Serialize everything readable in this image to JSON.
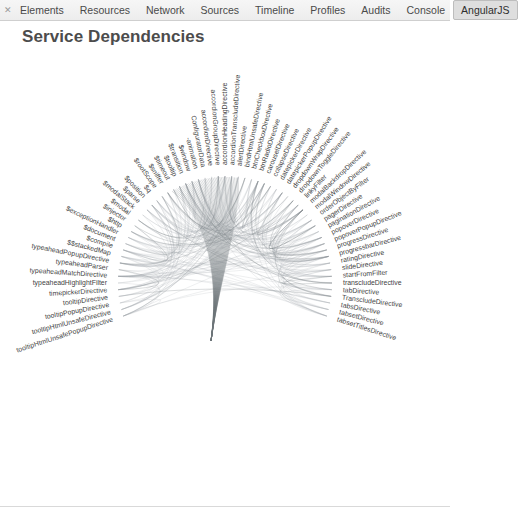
{
  "window": {
    "close_icon": "close-icon",
    "close_glyph": "✕"
  },
  "toolbar": {
    "tabs": [
      {
        "label": "Elements",
        "selected": false
      },
      {
        "label": "Resources",
        "selected": false
      },
      {
        "label": "Network",
        "selected": false
      },
      {
        "label": "Sources",
        "selected": false
      },
      {
        "label": "Timeline",
        "selected": false
      },
      {
        "label": "Profiles",
        "selected": false
      },
      {
        "label": "Audits",
        "selected": false
      },
      {
        "label": "Console",
        "selected": false
      },
      {
        "label": "AngularJS",
        "selected": true
      }
    ],
    "selected_tab": "AngularJS"
  },
  "panel": {
    "title": "Service Dependencies"
  },
  "colors": {
    "edge": "#9aa0a6",
    "label": "#3f3f3f",
    "title": "#4c4c4c",
    "tab_selected_bg": "#dedede",
    "toolbar_bg": "#f0f0f0",
    "background": "#ffffff"
  },
  "chart_data": {
    "type": "hierarchical-edge-bundling",
    "title": "Service Dependencies",
    "layout": "radial",
    "start_angle_deg": -108,
    "end_angle_deg": 108,
    "inner_radius": 108,
    "label_radius": 118,
    "center": {
      "x": 225,
      "y": 232
    },
    "nodes": [
      "tooltipHtmlUnsafePopupDirective",
      "tooltipHtmlUnsafeDirective",
      "tooltipPopupDirective",
      "tooltipDirective",
      "timepickerDirective",
      "typeaheadHighlightFilter",
      "typeaheadMatchDirective",
      "typeaheadParser",
      "typeaheadPopupDirective",
      "$$stackedMap",
      "$compile",
      "$document",
      "$exceptionHandler",
      "$http",
      "$injector",
      "$modal",
      "$modalStack",
      "$parse",
      "$position",
      "$q",
      "$rootScope",
      "$sniffer",
      "$timeout",
      "$tooltip",
      "$transition",
      "$window",
      "-animation",
      "ConfiguratorData",
      "accordionDirective",
      "accordionGroupDirective",
      "accordionHeadingDirective",
      "accordionTranscludeDirective",
      "alertDirective",
      "bindHtmlUnsafeDirective",
      "btnCheckboxDirective",
      "btnRadioDirective",
      "carouselDirective",
      "collapseDirective",
      "datepickerDirective",
      "datepickerPopupDirective",
      "dropdownWrapDirective",
      "dropdownToggleDirective",
      "linkyFilter",
      "modalBackdropDirective",
      "modalWindowDirective",
      "orderObjectByFilter",
      "pagerDirective",
      "paginationDirective",
      "popoverDirective",
      "popoverPopupDirective",
      "progressDirective",
      "progressbarDirective",
      "ratingDirective",
      "slideDirective",
      "startFromFilter",
      "transcludeDirective",
      "tabDirective",
      "TranscludeDirective",
      "tabsDirective",
      "tabsetDirective",
      "tabsetTitlesDirective"
    ],
    "node_count": 61,
    "edge_count": 220,
    "legend": [],
    "grid": false
  }
}
